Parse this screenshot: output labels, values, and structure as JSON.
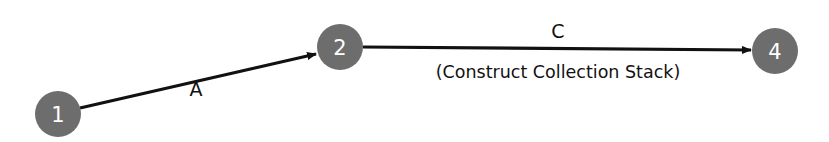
{
  "diagram": {
    "type": "network-activity-diagram",
    "colors": {
      "node_fill": "#6d6d6d",
      "node_text": "#ffffff",
      "edge": "#111111",
      "background": "#ffffff"
    },
    "nodes": [
      {
        "id": "1",
        "label": "1",
        "cx": 58,
        "cy": 114,
        "r": 23
      },
      {
        "id": "2",
        "label": "2",
        "cx": 340,
        "cy": 47,
        "r": 23
      },
      {
        "id": "4",
        "label": "4",
        "cx": 775,
        "cy": 51,
        "r": 23
      }
    ],
    "edges": [
      {
        "id": "A",
        "from": "1",
        "to": "2",
        "label": "A",
        "sublabel": ""
      },
      {
        "id": "C",
        "from": "2",
        "to": "4",
        "label": "C",
        "sublabel": "(Construct Collection Stack)"
      }
    ]
  }
}
